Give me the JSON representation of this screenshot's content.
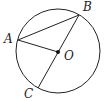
{
  "diagram": {
    "type": "circle-geometry",
    "circle": {
      "center": "O",
      "cx": 58,
      "cy": 51,
      "r": 42
    },
    "points": [
      {
        "name": "A",
        "label": "A",
        "x": 18,
        "y": 40,
        "lx": 4,
        "ly": 43
      },
      {
        "name": "B",
        "label": "B",
        "x": 79,
        "y": 15,
        "lx": 83,
        "ly": 11
      },
      {
        "name": "C",
        "label": "C",
        "x": 38,
        "y": 88,
        "lx": 24,
        "ly": 98
      },
      {
        "name": "O",
        "label": "O",
        "x": 58,
        "y": 52,
        "lx": 64,
        "ly": 60
      }
    ],
    "segments": [
      {
        "from": "A",
        "to": "B"
      },
      {
        "from": "A",
        "to": "O"
      },
      {
        "from": "B",
        "to": "C"
      }
    ],
    "stroke_color": "#222222"
  }
}
